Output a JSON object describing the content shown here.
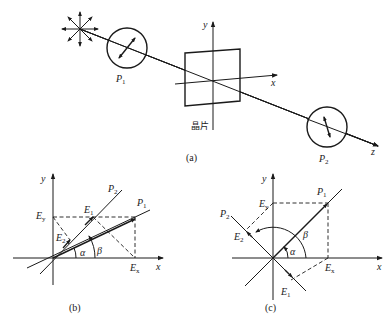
{
  "figure": {
    "panel_a": {
      "caption": "(a)",
      "polarizer1": "P",
      "polarizer1_sub": "1",
      "polarizer2": "P",
      "polarizer2_sub": "2",
      "crystal_label": "晶片",
      "axis_x": "x",
      "axis_y": "y",
      "axis_z": "z",
      "light_source_icon": "unpolarized-light-star"
    },
    "panel_b": {
      "caption": "(b)",
      "axis_x": "x",
      "axis_y": "y",
      "P1": "P",
      "P1_sub": "1",
      "P2": "P",
      "P2_sub": "2",
      "E1": "E",
      "E1_sub": "1",
      "E2": "E",
      "E2_sub": "2",
      "Ex": "E",
      "Ex_sub": "x",
      "Ey": "E",
      "Ey_sub": "y",
      "alpha": "α",
      "beta": "β"
    },
    "panel_c": {
      "caption": "(c)",
      "axis_x": "x",
      "axis_y": "y",
      "P1": "P",
      "P1_sub": "1",
      "P2": "P",
      "P2_sub": "2",
      "E1": "E",
      "E1_sub": "1",
      "E2": "E",
      "E2_sub": "2",
      "Ex": "E",
      "Ex_sub": "x",
      "Ey": "E",
      "Ey_sub": "y",
      "alpha": "α",
      "beta": "β"
    }
  }
}
